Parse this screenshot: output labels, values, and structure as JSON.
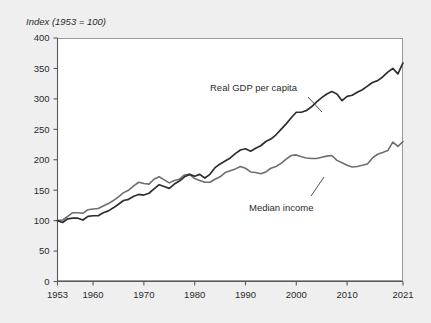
{
  "chart_data": {
    "type": "line",
    "title": "Index (1953 = 100)",
    "xlabel": "",
    "ylabel": "",
    "xlim": [
      1953,
      2021
    ],
    "ylim": [
      0,
      400
    ],
    "ytick_step": 50,
    "yticks": [
      0,
      50,
      100,
      150,
      200,
      250,
      300,
      350,
      400
    ],
    "xticks": [
      1953,
      1960,
      1970,
      1980,
      1990,
      2000,
      2010,
      2021
    ],
    "grid": false,
    "legend_position": "inline-annotations",
    "annotations": [
      {
        "text": "Real GDP per capita",
        "series": "Real GDP per capita"
      },
      {
        "text": "Median income",
        "series": "Median income"
      }
    ],
    "colors": {
      "background": "#efefef",
      "plot_background": "#ffffff",
      "real_gdp_per_capita": "#2e2e2e",
      "median_income": "#6e6e6e",
      "axis": "#5a5a5a",
      "frame": "#9a9a9a",
      "text": "#2b2b2b"
    },
    "x": [
      1953,
      1954,
      1955,
      1956,
      1957,
      1958,
      1959,
      1960,
      1961,
      1962,
      1963,
      1964,
      1965,
      1966,
      1967,
      1968,
      1969,
      1970,
      1971,
      1972,
      1973,
      1974,
      1975,
      1976,
      1977,
      1978,
      1979,
      1980,
      1981,
      1982,
      1983,
      1984,
      1985,
      1986,
      1987,
      1988,
      1989,
      1990,
      1991,
      1992,
      1993,
      1994,
      1995,
      1996,
      1997,
      1998,
      1999,
      2000,
      2001,
      2002,
      2003,
      2004,
      2005,
      2006,
      2007,
      2008,
      2009,
      2010,
      2011,
      2012,
      2013,
      2014,
      2015,
      2016,
      2017,
      2018,
      2019,
      2020,
      2021
    ],
    "series": [
      {
        "name": "Real GDP per capita",
        "color": "#2e2e2e",
        "values": [
          100,
          97,
          103,
          104,
          104,
          101,
          107,
          108,
          108,
          113,
          116,
          121,
          127,
          133,
          135,
          140,
          143,
          142,
          145,
          152,
          159,
          156,
          153,
          160,
          165,
          172,
          176,
          173,
          176,
          170,
          176,
          187,
          193,
          198,
          203,
          210,
          216,
          218,
          214,
          219,
          223,
          230,
          234,
          241,
          250,
          259,
          269,
          278,
          278,
          281,
          287,
          295,
          302,
          308,
          312,
          308,
          297,
          304,
          306,
          311,
          315,
          321,
          327,
          330,
          336,
          344,
          350,
          341,
          359
        ]
      },
      {
        "name": "Median income",
        "color": "#6e6e6e",
        "values": [
          100,
          101,
          107,
          113,
          113,
          112,
          118,
          119,
          120,
          124,
          128,
          133,
          139,
          146,
          150,
          157,
          163,
          161,
          160,
          168,
          172,
          167,
          162,
          166,
          168,
          175,
          176,
          169,
          166,
          163,
          163,
          168,
          172,
          179,
          182,
          185,
          189,
          186,
          180,
          179,
          177,
          180,
          186,
          189,
          194,
          201,
          207,
          208,
          205,
          203,
          202,
          202,
          204,
          206,
          207,
          199,
          195,
          191,
          188,
          189,
          191,
          193,
          203,
          209,
          212,
          215,
          229,
          222,
          230
        ]
      }
    ]
  }
}
